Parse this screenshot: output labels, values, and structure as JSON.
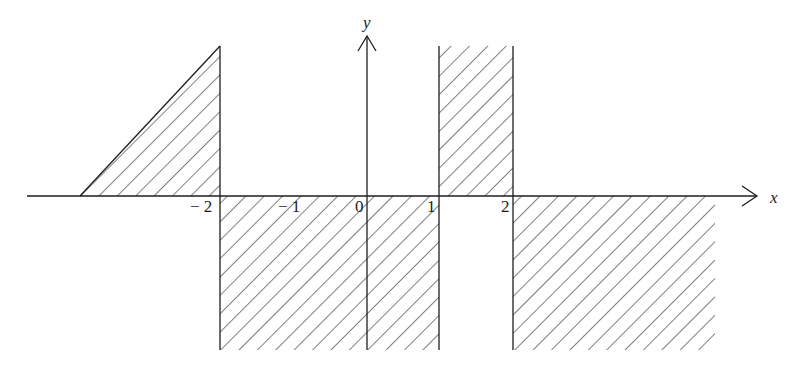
{
  "diagram": {
    "type": "region-plot",
    "axes": {
      "x_label": "x",
      "y_label": "y"
    },
    "tick_labels": {
      "neg2": "− 2",
      "neg1": "− 1",
      "zero": "0",
      "one": "1",
      "two": "2"
    },
    "regions": [
      {
        "name": "triangle-left",
        "description": "Hatched triangle above x-axis, left of x = -2"
      },
      {
        "name": "strip-below-neg2-to-1",
        "description": "Hatched region below x-axis for -2 < x < 1"
      },
      {
        "name": "strip-above-1-to-2",
        "description": "Hatched region above x-axis for 1 < x < 2"
      },
      {
        "name": "region-below-beyond-2",
        "description": "Hatched region below x-axis for x > 2"
      }
    ],
    "colors": {
      "ink": "#1e1e1e",
      "background": "#ffffff"
    }
  }
}
